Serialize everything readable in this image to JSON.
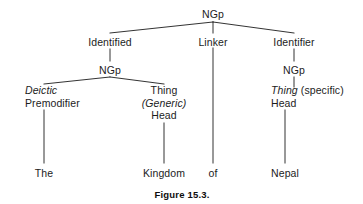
{
  "figure": {
    "caption": "Figure 15.3.",
    "caption_x": 182,
    "caption_y": 189,
    "background": "#ffffff",
    "ink": "#1c1c1c"
  },
  "tree": {
    "root": {
      "id": "root-ngp",
      "label": "NGp",
      "x": 213,
      "y": 8
    },
    "level2": [
      {
        "id": "identified",
        "label": "Identified",
        "x": 110,
        "y": 36
      },
      {
        "id": "linker",
        "label": "Linker",
        "x": 213,
        "y": 36
      },
      {
        "id": "identifier",
        "label": "Identifier",
        "x": 294,
        "y": 36
      }
    ],
    "level3": [
      {
        "id": "left-ngp",
        "label": "NGp",
        "x": 110,
        "y": 64
      },
      {
        "id": "right-ngp",
        "label": "NGp",
        "x": 294,
        "y": 64
      }
    ],
    "level4": [
      {
        "id": "deictic-premodifier",
        "x": 25,
        "y": 84,
        "align": "left",
        "lines": [
          {
            "text": "Deictic",
            "style": "italic"
          },
          {
            "text": "Premodifier",
            "style": "normal"
          }
        ]
      },
      {
        "id": "thing-generic-head",
        "x": 164,
        "y": 84,
        "align": "center",
        "lines": [
          {
            "text": "Thing",
            "style": "normal"
          },
          {
            "text": "(Generic)",
            "style": "italic"
          },
          {
            "text": "Head",
            "style": "normal"
          }
        ]
      },
      {
        "id": "thing-specific-head",
        "x": 271,
        "y": 84,
        "align": "left",
        "lines": [
          {
            "text": "Thing (specific)",
            "style": "mixed-italic-first"
          },
          {
            "text": "Head",
            "style": "normal"
          }
        ]
      }
    ],
    "leaves": [
      {
        "id": "leaf-the",
        "label": "The",
        "x": 44,
        "y": 167
      },
      {
        "id": "leaf-kingdom",
        "label": "Kingdom",
        "x": 164,
        "y": 167
      },
      {
        "id": "leaf-of",
        "label": "of",
        "x": 213,
        "y": 167
      },
      {
        "id": "leaf-nepal",
        "label": "Nepal",
        "x": 285,
        "y": 167
      }
    ],
    "edges": [
      {
        "id": "edge-root-identified",
        "x1": 213,
        "y1": 22,
        "x2": 110,
        "y2": 33
      },
      {
        "id": "edge-root-linker",
        "x1": 213,
        "y1": 22,
        "x2": 213,
        "y2": 33
      },
      {
        "id": "edge-root-identifier",
        "x1": 213,
        "y1": 22,
        "x2": 294,
        "y2": 33
      },
      {
        "id": "edge-identified-ngp",
        "x1": 110,
        "y1": 49,
        "x2": 110,
        "y2": 61
      },
      {
        "id": "edge-identifier-ngp",
        "x1": 294,
        "y1": 49,
        "x2": 294,
        "y2": 61
      },
      {
        "id": "edge-leftngp-deictic",
        "x1": 110,
        "y1": 77,
        "x2": 44,
        "y2": 84
      },
      {
        "id": "edge-leftngp-thing",
        "x1": 110,
        "y1": 77,
        "x2": 164,
        "y2": 84
      },
      {
        "id": "edge-rightngp-thing",
        "x1": 294,
        "y1": 77,
        "x2": 294,
        "y2": 87
      },
      {
        "id": "edge-premodifier-the",
        "x1": 44,
        "y1": 110,
        "x2": 44,
        "y2": 163
      },
      {
        "id": "edge-head-kingdom",
        "x1": 164,
        "y1": 123,
        "x2": 164,
        "y2": 163
      },
      {
        "id": "edge-linker-of",
        "x1": 213,
        "y1": 48,
        "x2": 213,
        "y2": 163
      },
      {
        "id": "edge-head-nepal",
        "x1": 285,
        "y1": 110,
        "x2": 285,
        "y2": 163
      }
    ]
  }
}
